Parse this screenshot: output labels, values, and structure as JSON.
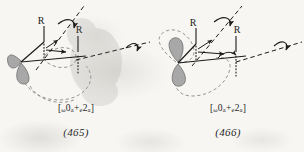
{
  "figure": {
    "kind": "orbital-stereochemistry-diagram-pair",
    "background_color": "#f7f6f3",
    "ink_color": "#1b1b1b",
    "lobe_fill_color": "#a8a8a8",
    "lobe_stroke_color": "#6e6e6e",
    "dashed_outline_color": "#8a8a8a"
  },
  "panels": [
    {
      "id": "panel-465",
      "formula_prefix": "[",
      "formula_sub1": "ω",
      "formula_term1": "0",
      "formula_sub2": "a",
      "formula_plus": "+",
      "formula_sub3": "e",
      "formula_term2": "2",
      "formula_sub4": "a",
      "formula_suffix": "]",
      "number": "(465)",
      "substituent_labels": [
        "R",
        "R"
      ],
      "rotation_axes": [
        {
          "name": "tilted-dashed-axis",
          "orientation": "diagonal-up-right"
        },
        {
          "name": "horizontal-dashed-axis",
          "orientation": "horizontal-right"
        }
      ],
      "orbital_lobes": 2,
      "dashed_orbital_outline": true
    },
    {
      "id": "panel-466",
      "formula_prefix": "[",
      "formula_sub1": "ω",
      "formula_term1": "0",
      "formula_sub2": "a",
      "formula_plus": "+",
      "formula_sub3": "e",
      "formula_term2": "2",
      "formula_sub4": "a",
      "formula_suffix": "]",
      "number": "(466)",
      "substituent_labels": [
        "R",
        "R"
      ],
      "rotation_axes": [
        {
          "name": "tilted-dashed-axis",
          "orientation": "diagonal-up-right"
        },
        {
          "name": "horizontal-dashed-axis",
          "orientation": "horizontal-right"
        }
      ],
      "orbital_lobes": 2,
      "dashed_orbital_outline": true
    }
  ]
}
